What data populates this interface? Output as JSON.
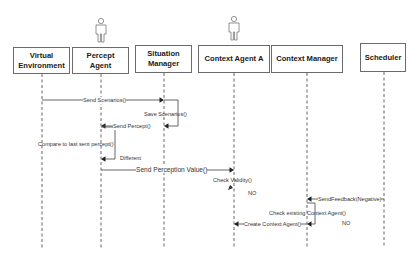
{
  "diagram": {
    "type": "uml-sequence",
    "participants": [
      {
        "id": "ve",
        "label": "Virtual\nEnvironment",
        "x": 13,
        "y": 47,
        "w": 57,
        "h": 27,
        "lifeline_x": 42,
        "actor": false
      },
      {
        "id": "pa",
        "label": "Percept\nAgent",
        "x": 72,
        "y": 47,
        "w": 57,
        "h": 27,
        "lifeline_x": 101,
        "actor": true
      },
      {
        "id": "sm",
        "label": "Situation\nManager",
        "x": 135,
        "y": 45,
        "w": 57,
        "h": 28,
        "lifeline_x": 164,
        "actor": false
      },
      {
        "id": "caa",
        "label": "Context Agent A",
        "x": 198,
        "y": 45,
        "w": 72,
        "h": 28,
        "lifeline_x": 234,
        "actor": true
      },
      {
        "id": "cm",
        "label": "Context Manager",
        "x": 271,
        "y": 45,
        "w": 72,
        "h": 28,
        "lifeline_x": 307,
        "actor": false
      },
      {
        "id": "sch",
        "label": "Scheduler",
        "x": 360,
        "y": 43,
        "w": 46,
        "h": 29,
        "lifeline_x": 384,
        "actor": false
      }
    ],
    "lifeline_end_y": 248,
    "messages": [
      {
        "id": "m1",
        "label": "Send Scenarios()",
        "from": "ve",
        "to": "sm",
        "y": 100,
        "kind": "call",
        "label_x": 83,
        "label_y": 97
      },
      {
        "id": "m2",
        "label": "Save Scenarios()",
        "from": "sm",
        "to": "sm",
        "y": 100,
        "kind": "self",
        "return_y": 126,
        "self_w": 14,
        "label_x": 144,
        "label_y": 111
      },
      {
        "id": "m3",
        "label": "Send Percept()",
        "from": "sm",
        "to": "pa",
        "y": 126,
        "kind": "call-from-bar",
        "start_x": 149,
        "label_x": 113,
        "label_y": 123
      },
      {
        "id": "m4",
        "label": "Compare to last sent percept()",
        "from": "pa",
        "to": "pa",
        "y": 127,
        "kind": "self",
        "return_y": 159,
        "self_w": 14,
        "label_x": 38,
        "label_y": 141
      },
      {
        "id": "m5",
        "label": "Send Perception Value()",
        "from": "pa",
        "to": "caa",
        "y": 170,
        "kind": "call",
        "label_x": 136,
        "label_y": 166,
        "big": true
      },
      {
        "id": "m6",
        "label": "Check Validity()",
        "from": "caa",
        "to": "caa",
        "y": 180,
        "kind": "note-arrow",
        "label_x": 213,
        "label_y": 177
      },
      {
        "id": "m7",
        "label": "SendFeedback(Negative)",
        "from": "sch",
        "to": "cm",
        "y": 199,
        "kind": "call",
        "label_x": 318,
        "label_y": 196
      },
      {
        "id": "m8",
        "label": "Check existing Context Agent()",
        "from": "cm",
        "to": "cm",
        "y": 203,
        "kind": "self",
        "return_y": 224,
        "self_w": 8,
        "label_x": 269,
        "label_y": 210
      },
      {
        "id": "m9",
        "label": "Create Context Agent()",
        "from": "cm",
        "to": "caa",
        "y": 224,
        "kind": "call",
        "label_x": 244,
        "label_y": 221
      }
    ],
    "annotations": [
      {
        "id": "a1",
        "label": "Different",
        "x": 120,
        "y": 155
      },
      {
        "id": "a2",
        "label": "NO",
        "x": 248,
        "y": 190
      },
      {
        "id": "a3",
        "label": "NO",
        "x": 342,
        "y": 220
      }
    ],
    "colors": {
      "line": "#555555",
      "box_border": "#6b6b6b",
      "text": "#1a1a1a",
      "arrow": "#222222"
    }
  }
}
